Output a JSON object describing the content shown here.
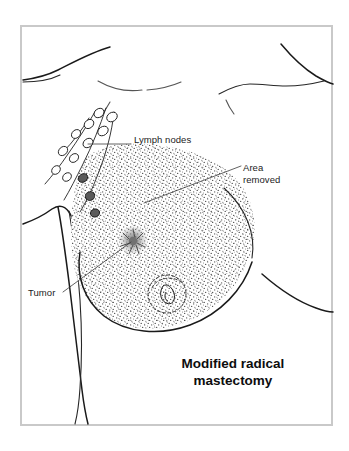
{
  "figure": {
    "domain_type": "medical-illustration",
    "title_line_1": "Modified radical",
    "title_line_2": "mastectomy",
    "frame_color": "#c9c9c9",
    "background_color": "#ffffff",
    "ink_color": "#1a1a1a",
    "stipple_color": "#3c3c3c"
  },
  "labels": {
    "lymph_nodes": "Lymph nodes",
    "area_removed_line_1": "Area",
    "area_removed_line_2": "removed",
    "tumor": "Tumor"
  },
  "annotations": [
    {
      "name": "lymph-nodes",
      "text": "Lymph nodes",
      "leader_from_x": 131,
      "leader_from_y": 144,
      "leader_to_x": 88,
      "leader_to_y": 144
    },
    {
      "name": "area-removed",
      "text": "Area removed",
      "leader_from_x": 241,
      "leader_from_y": 166,
      "leader_to_x": 144,
      "leader_to_y": 203
    },
    {
      "name": "tumor",
      "text": "Tumor",
      "leader_from_x": 63,
      "leader_from_y": 292,
      "leader_to_x": 131,
      "leader_to_y": 242
    }
  ],
  "anatomy_parts": [
    {
      "name": "left-shoulder-clavicle",
      "description": "left shoulder and clavicle contour"
    },
    {
      "name": "sternal-notch",
      "description": "faint arc at base of neck"
    },
    {
      "name": "right-shoulder-clavicle",
      "description": "right shoulder and clavicle contour"
    },
    {
      "name": "left-arm-outer",
      "description": "outer contour of raised left arm"
    },
    {
      "name": "left-arm-inner",
      "description": "inner contour of raised left arm"
    },
    {
      "name": "axilla-fold",
      "description": "armpit fold"
    },
    {
      "name": "breast-outline",
      "description": "outline of affected breast"
    },
    {
      "name": "opposite-breast-underside",
      "description": "underside curve of opposite breast"
    }
  ],
  "lymph_node_chain": {
    "name": "axillary-lymph-node-chain",
    "normal_node_count": 10,
    "involved_node_count": 3,
    "description": "chain of axillary lymph nodes along lymphatic vessels"
  },
  "area_removed_region": {
    "name": "stippled-resection-area",
    "fill": "stipple",
    "description": "teardrop shaped stippled region covering breast and axillary tail"
  },
  "tumor_mass": {
    "name": "tumor-mass",
    "center_x": 133,
    "center_y": 240,
    "description": "dense stippled mass in upper inner breast"
  },
  "nipple_areola": {
    "name": "nipple-areola-complex",
    "center_x": 167,
    "center_y": 294,
    "areola_radius": 19
  }
}
